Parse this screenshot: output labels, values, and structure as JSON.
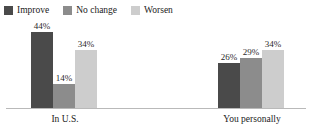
{
  "chart_data": {
    "type": "bar",
    "title": "",
    "subtitle": "",
    "xlabel": "",
    "ylabel": "",
    "grid": false,
    "legend_position": "top-left",
    "value_suffix": "%",
    "ylim": [
      0,
      50
    ],
    "categories": [
      "In U.S.",
      "You personally"
    ],
    "series": [
      {
        "name": "Improve",
        "color": "#4a4a4a",
        "values": [
          44,
          26
        ]
      },
      {
        "name": "No change",
        "color": "#8c8c8c",
        "values": [
          14,
          29
        ]
      },
      {
        "name": "Worsen",
        "color": "#cdcdcd",
        "values": [
          34,
          34
        ]
      }
    ],
    "labels": {
      "In U.S.": [
        "44%",
        "14%",
        "34%"
      ],
      "You personally": [
        "26%",
        "29%",
        "34%"
      ]
    }
  },
  "legend": {
    "items": [
      {
        "label": "Improve",
        "color": "#4a4a4a"
      },
      {
        "label": "No change",
        "color": "#8c8c8c"
      },
      {
        "label": "Worsen",
        "color": "#cdcdcd"
      }
    ]
  },
  "axis": {
    "baseline_color": "#b9b9b9",
    "categories": [
      "In U.S.",
      "You personally"
    ]
  }
}
